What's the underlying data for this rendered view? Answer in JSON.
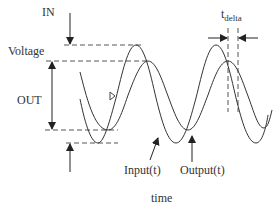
{
  "labels": {
    "in": "IN",
    "voltage": "Voltage",
    "out": "OUT",
    "t_delta_main": "t",
    "t_delta_sub": "delta",
    "input": "Input(t)",
    "output": "Output(t)",
    "time": "time"
  },
  "colors": {
    "line": "#333333",
    "dashed": "#555555",
    "background": "#ffffff"
  },
  "waveforms": {
    "input": {
      "name": "Input(t)",
      "peak_y": 45,
      "trough_y": 143,
      "description": "larger amplitude sine wave, leading"
    },
    "output": {
      "name": "Output(t)",
      "peak_y": 61,
      "trough_y": 130,
      "description": "smaller amplitude sine wave, lagging by t_delta"
    }
  }
}
